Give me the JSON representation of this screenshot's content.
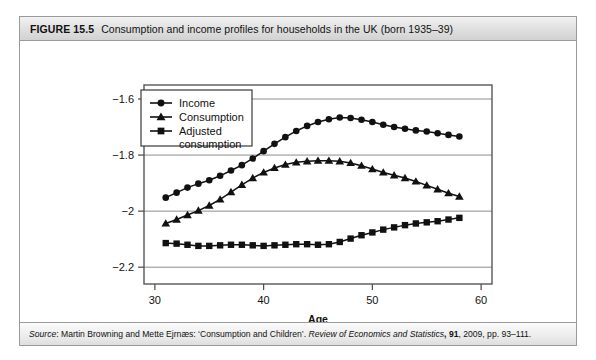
{
  "figure": {
    "number": "FIGURE 15.5",
    "title": "Consumption and income profiles for households in the UK (born 1935–39)",
    "source_prefix": "Source",
    "source_rest": ": Martin Browning and Mette Ejrnæs: ‘Consumption and Children’. ",
    "source_journal": "Review of Economics and Statistics",
    "source_volume": "91",
    "source_tail": ", 2009, pp. 93–111."
  },
  "colors": {
    "ink": "#111111",
    "frame": "#9a9a9a",
    "gridline": "#8c8c8c",
    "plot_border": "#4a4a4a",
    "header_bg": "#e4e4e4",
    "page_bg": "#ffffff"
  },
  "chart_data": {
    "type": "line",
    "title": "Consumption and income profiles for households in the UK (born 1935–39)",
    "xlabel": "Age",
    "ylabel": "",
    "xlim": [
      29,
      61
    ],
    "ylim": [
      -2.26,
      -1.55
    ],
    "xticks": [
      30,
      40,
      50,
      60
    ],
    "yticks": [
      -1.6,
      -1.8,
      -2,
      -2.2
    ],
    "ytick_labels": [
      "−1.6",
      "−1.8",
      "−2",
      "−2.2"
    ],
    "xtick_labels": [
      "30",
      "40",
      "50",
      "60"
    ],
    "grid": "horizontal",
    "legend_position": "top-left",
    "series": [
      {
        "name": "Income",
        "marker": "circle",
        "x": [
          31,
          32,
          33,
          34,
          35,
          36,
          37,
          38,
          39,
          40,
          41,
          42,
          43,
          44,
          45,
          46,
          47,
          48,
          49,
          50,
          51,
          52,
          53,
          54,
          55,
          56,
          57,
          58
        ],
        "values": [
          -1.952,
          -1.934,
          -1.916,
          -1.902,
          -1.89,
          -1.874,
          -1.855,
          -1.836,
          -1.812,
          -1.786,
          -1.76,
          -1.736,
          -1.714,
          -1.696,
          -1.682,
          -1.672,
          -1.666,
          -1.668,
          -1.674,
          -1.682,
          -1.692,
          -1.7,
          -1.706,
          -1.712,
          -1.716,
          -1.722,
          -1.728,
          -1.734
        ]
      },
      {
        "name": "Consumption",
        "marker": "triangle",
        "x": [
          31,
          32,
          33,
          34,
          35,
          36,
          37,
          38,
          39,
          40,
          41,
          42,
          43,
          44,
          45,
          46,
          47,
          48,
          49,
          50,
          51,
          52,
          53,
          54,
          55,
          56,
          57,
          58
        ],
        "values": [
          -2.044,
          -2.03,
          -2.014,
          -1.998,
          -1.98,
          -1.958,
          -1.932,
          -1.906,
          -1.882,
          -1.862,
          -1.846,
          -1.834,
          -1.826,
          -1.822,
          -1.82,
          -1.82,
          -1.822,
          -1.828,
          -1.838,
          -1.85,
          -1.862,
          -1.872,
          -1.882,
          -1.894,
          -1.908,
          -1.922,
          -1.936,
          -1.948
        ]
      },
      {
        "name": "Adjusted consumption",
        "marker": "square",
        "x": [
          31,
          32,
          33,
          34,
          35,
          36,
          37,
          38,
          39,
          40,
          41,
          42,
          43,
          44,
          45,
          46,
          47,
          48,
          49,
          50,
          51,
          52,
          53,
          54,
          55,
          56,
          57,
          58
        ],
        "values": [
          -2.114,
          -2.116,
          -2.12,
          -2.124,
          -2.124,
          -2.122,
          -2.12,
          -2.12,
          -2.122,
          -2.124,
          -2.122,
          -2.12,
          -2.118,
          -2.118,
          -2.12,
          -2.118,
          -2.11,
          -2.098,
          -2.086,
          -2.076,
          -2.066,
          -2.058,
          -2.05,
          -2.044,
          -2.04,
          -2.036,
          -2.03,
          -2.024
        ]
      }
    ],
    "legend": [
      {
        "label": "Income",
        "marker": "circle"
      },
      {
        "label": "Consumption",
        "marker": "triangle"
      },
      {
        "label": "Adjusted consumption",
        "marker": "square",
        "label_line1": "Adjusted",
        "label_line2": "consumption"
      }
    ]
  }
}
